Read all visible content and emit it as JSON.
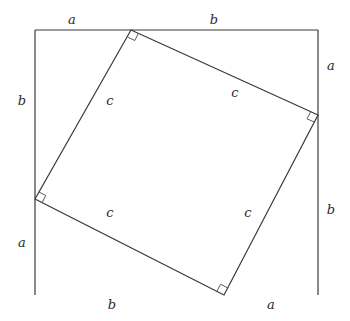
{
  "diagram": {
    "title": "",
    "outer_square": {
      "x0": 35,
      "y0": 30,
      "x1": 318,
      "y1": 295,
      "bottom_edge_gradient": {
        "left": "#5a5ad8",
        "mid": "#9a9aa8",
        "right": "#b8d040"
      }
    },
    "inner_square": {
      "vertices": [
        [
          131,
          30
        ],
        [
          318,
          115
        ],
        [
          224,
          295
        ],
        [
          35,
          199
        ]
      ]
    },
    "labels": {
      "top_left": "a",
      "top_right": "b",
      "right_top": "a",
      "right_bottom": "b",
      "bottom_right": "a",
      "bottom_left": "b",
      "left_bottom": "a",
      "left_top": "b",
      "hyp_top_left": "c",
      "hyp_top_right": "c",
      "hyp_bottom_left": "c",
      "hyp_bottom_right": "c"
    },
    "right_angle_markers": 4
  }
}
